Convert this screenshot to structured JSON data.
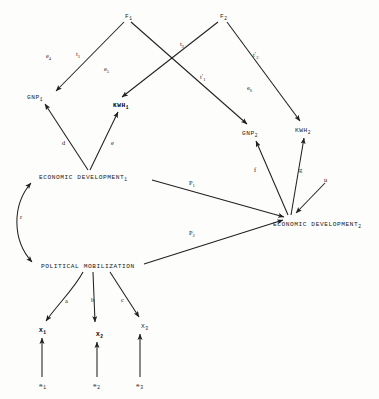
{
  "diagram": {
    "type": "path-diagram",
    "background_color": "#fdfdfb",
    "line_color": "#222222",
    "nodes": [
      {
        "id": "F1",
        "label": "F",
        "sub": "1",
        "bold": false,
        "x": 125,
        "y": 14
      },
      {
        "id": "F2",
        "label": "F",
        "sub": "2",
        "bold": false,
        "x": 220,
        "y": 14
      },
      {
        "id": "GNP1",
        "label": "GNP",
        "sub": "1",
        "bold": false,
        "x": 27,
        "y": 95
      },
      {
        "id": "KWH1",
        "label": "KWH",
        "sub": "1",
        "bold": true,
        "x": 113,
        "y": 103
      },
      {
        "id": "GNP2",
        "label": "GNP",
        "sub": "2",
        "bold": false,
        "x": 242,
        "y": 131
      },
      {
        "id": "KWH2",
        "label": "KWH",
        "sub": "2",
        "bold": false,
        "x": 295,
        "y": 128
      },
      {
        "id": "ED1",
        "label": "ECONOMIC DEVELOPMENT",
        "sub": "1",
        "bold": false,
        "x": 39,
        "y": 175
      },
      {
        "id": "ED2",
        "label": "ECONOMIC DEVELOPMENT",
        "sub": "2",
        "bold": false,
        "x": 273,
        "y": 222
      },
      {
        "id": "PM",
        "label": "POLITICAL MOBILIZATION",
        "sub": "",
        "bold": false,
        "x": 41,
        "y": 264
      },
      {
        "id": "X1",
        "label": "X",
        "sub": "1",
        "bold": true,
        "x": 39,
        "y": 328
      },
      {
        "id": "X2",
        "label": "X",
        "sub": "2",
        "bold": true,
        "x": 96,
        "y": 332
      },
      {
        "id": "X3",
        "label": "X",
        "sub": "3",
        "bold": false,
        "x": 141,
        "y": 324
      },
      {
        "id": "e1",
        "label": "e",
        "sub": "1",
        "bold": false,
        "x": 39,
        "y": 383
      },
      {
        "id": "e2",
        "label": "e",
        "sub": "2",
        "bold": false,
        "x": 93,
        "y": 383
      },
      {
        "id": "e3",
        "label": "e",
        "sub": "3",
        "bold": false,
        "x": 136,
        "y": 383
      }
    ],
    "path_labels": [
      {
        "id": "e4",
        "label": "e",
        "sub": "4",
        "prime": "",
        "x": 46,
        "y": 52
      },
      {
        "id": "t1",
        "label": "t",
        "sub": "1",
        "prime": "",
        "x": 76,
        "y": 50
      },
      {
        "id": "e5",
        "label": "e",
        "sub": "5",
        "prime": "",
        "x": 104,
        "y": 65
      },
      {
        "id": "t2",
        "label": "t",
        "sub": "2",
        "prime": "",
        "x": 180,
        "y": 40
      },
      {
        "id": "t2p",
        "label": "t",
        "sub": "2",
        "prime": "′",
        "x": 253,
        "y": 51
      },
      {
        "id": "t1p",
        "label": "t",
        "sub": "1",
        "prime": "′",
        "x": 200,
        "y": 73
      },
      {
        "id": "e6",
        "label": "e",
        "sub": "6",
        "prime": "",
        "x": 247,
        "y": 84
      },
      {
        "id": "d",
        "label": "d",
        "sub": "",
        "prime": "",
        "x": 62,
        "y": 139
      },
      {
        "id": "e",
        "label": "e",
        "sub": "",
        "prime": "",
        "x": 111,
        "y": 139
      },
      {
        "id": "f",
        "label": "f",
        "sub": "",
        "prime": "",
        "x": 254,
        "y": 166
      },
      {
        "id": "g",
        "label": "g",
        "sub": "",
        "prime": "",
        "x": 299,
        "y": 166
      },
      {
        "id": "u",
        "label": "u",
        "sub": "",
        "prime": "",
        "x": 324,
        "y": 176
      },
      {
        "id": "P1",
        "label": "P",
        "sub": "1",
        "prime": "",
        "x": 189,
        "y": 179
      },
      {
        "id": "P2",
        "label": "P",
        "sub": "2",
        "prime": "",
        "x": 189,
        "y": 229
      },
      {
        "id": "r",
        "label": "r",
        "sub": "",
        "prime": "",
        "x": 20,
        "y": 213
      },
      {
        "id": "a",
        "label": "a",
        "sub": "",
        "prime": "",
        "x": 65,
        "y": 297
      },
      {
        "id": "b",
        "label": "b",
        "sub": "",
        "prime": "",
        "x": 91,
        "y": 296
      },
      {
        "id": "c",
        "label": "c",
        "sub": "",
        "prime": "",
        "x": 121,
        "y": 296
      }
    ],
    "edges": [
      {
        "id": "F1-GNP1",
        "from": "F1",
        "to": "GNP1",
        "label": "t1",
        "style": "arrow"
      },
      {
        "id": "F1-GNP2",
        "from": "F1",
        "to": "GNP2",
        "label": "t1p",
        "style": "arrow"
      },
      {
        "id": "F2-KWH1",
        "from": "F2",
        "to": "KWH1",
        "label": "t2",
        "style": "arrow"
      },
      {
        "id": "F2-KWH2",
        "from": "F2",
        "to": "KWH2",
        "label": "t2p",
        "style": "arrow"
      },
      {
        "id": "ED1-GNP1",
        "from": "ED1",
        "to": "GNP1",
        "label": "d",
        "style": "arrow"
      },
      {
        "id": "ED1-KWH1",
        "from": "ED1",
        "to": "KWH1",
        "label": "e",
        "style": "arrow"
      },
      {
        "id": "ED2-GNP2",
        "from": "ED2",
        "to": "GNP2",
        "label": "f",
        "style": "arrow"
      },
      {
        "id": "ED2-KWH2",
        "from": "ED2",
        "to": "KWH2",
        "label": "g",
        "style": "arrow"
      },
      {
        "id": "u-ED2",
        "from": "u",
        "to": "ED2",
        "label": "u",
        "style": "arrow"
      },
      {
        "id": "ED1-ED2",
        "from": "ED1",
        "to": "ED2",
        "label": "P1",
        "style": "arrow"
      },
      {
        "id": "PM-ED2",
        "from": "PM",
        "to": "ED2",
        "label": "P2",
        "style": "arrow"
      },
      {
        "id": "ED1-PM",
        "from": "ED1",
        "to": "PM",
        "label": "r",
        "style": "double-curved"
      },
      {
        "id": "PM-X1",
        "from": "PM",
        "to": "X1",
        "label": "a",
        "style": "arrow"
      },
      {
        "id": "PM-X2",
        "from": "PM",
        "to": "X2",
        "label": "b",
        "style": "arrow"
      },
      {
        "id": "PM-X3",
        "from": "PM",
        "to": "X3",
        "label": "c",
        "style": "arrow"
      },
      {
        "id": "e1-X1",
        "from": "e1",
        "to": "X1",
        "label": "",
        "style": "arrow"
      },
      {
        "id": "e2-X2",
        "from": "e2",
        "to": "X2",
        "label": "",
        "style": "arrow"
      },
      {
        "id": "e3-X3",
        "from": "e3",
        "to": "X3",
        "label": "",
        "style": "arrow"
      }
    ]
  }
}
